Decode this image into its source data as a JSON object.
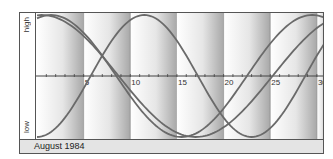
{
  "chart_data": {
    "type": "line",
    "title": "August 1984",
    "xlabel": "",
    "ylabel": "",
    "y_tick_labels": [
      "high",
      "low"
    ],
    "x_ticks": [
      5,
      10,
      15,
      20,
      25,
      30
    ],
    "xlim": [
      0,
      31
    ],
    "ylim": [
      -1,
      1
    ],
    "grid": false,
    "legend": null,
    "series": [
      {
        "name": "curve-23-day",
        "period": 23,
        "peak_day": 11.5,
        "x": [
          0,
          5.75,
          11.5,
          17.25,
          23,
          28.75,
          31
        ],
        "values": [
          -1,
          0,
          1,
          0,
          -1,
          0,
          0.57
        ]
      },
      {
        "name": "curve-28-day",
        "period": 28,
        "peak_day": 1.5,
        "x": [
          0,
          1.5,
          8.5,
          15.5,
          22.5,
          29.5,
          31
        ],
        "values": [
          0.97,
          1,
          0,
          -1,
          0,
          1,
          0.97
        ]
      },
      {
        "name": "curve-33-day",
        "period": 33,
        "peak_day": 0.5,
        "x": [
          0,
          0.5,
          8.75,
          17,
          25.25,
          31
        ],
        "values": [
          1,
          1,
          0,
          -1,
          0,
          0.82
        ]
      }
    ],
    "bands": [
      [
        0,
        5
      ],
      [
        5,
        10
      ],
      [
        10,
        15
      ],
      [
        15,
        20
      ],
      [
        20,
        25
      ],
      [
        25,
        30
      ],
      [
        30,
        31
      ]
    ]
  },
  "labels": {
    "high": "high",
    "low": "low",
    "month": "August 1984"
  },
  "colors": {
    "curve": "#6a6a6a",
    "axis": "#444444",
    "band_light": "#ffffff",
    "band_dark": "#a8a8a8",
    "footer": "#e4e4e4"
  }
}
